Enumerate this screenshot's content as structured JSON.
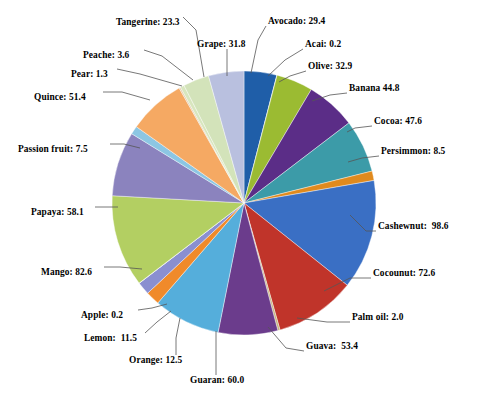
{
  "chart_data": {
    "type": "pie",
    "title": "",
    "subtitle": "",
    "xlabel": "",
    "ylabel": "",
    "legend_position": "none",
    "grid": false,
    "label_format": "name: value",
    "start_angle_deg": -90,
    "direction": "clockwise",
    "total": 723.9,
    "categories": [
      "Avocado",
      "Acai",
      "Olive",
      "Banana",
      "Cocoa",
      "Persimmon",
      "Cashewnut",
      "Cocounut",
      "Palm oil",
      "Guava",
      "Guaran",
      "Orange",
      "Lemon",
      "Apple",
      "Mango",
      "Papaya",
      "Passion fruit",
      "Quince",
      "Pear",
      "Peache",
      "Tangerine",
      "Grape"
    ],
    "values": [
      29.4,
      0.2,
      32.9,
      44.8,
      47.6,
      8.5,
      98.6,
      72.6,
      2.0,
      53.4,
      60.0,
      12.5,
      11.5,
      0.2,
      82.6,
      58.1,
      7.5,
      51.4,
      1.3,
      3.6,
      23.3,
      31.8
    ],
    "colors": [
      "#1F5EA8",
      "#E8EEF4",
      "#9BBB32",
      "#5B2D87",
      "#3C9BA8",
      "#E08A1E",
      "#3A6FC4",
      "#C0342A",
      "#C9B681",
      "#6B3C8C",
      "#55AEDB",
      "#F08A2A",
      "#8A8FD0",
      "#EAF0E0",
      "#B3CF62",
      "#8B83BE",
      "#8CC6E3",
      "#F5A963",
      "#E3C9A8",
      "#D8E6BE",
      "#D3E3BA",
      "#B9C0DF"
    ],
    "slices": [
      {
        "name": "Avocado",
        "label": "Avocado: 29.4",
        "value": 29.4,
        "color": "#1F5EA8"
      },
      {
        "name": "Acai",
        "label": "Acai: 0.2",
        "value": 0.2,
        "color": "#E8EEF4"
      },
      {
        "name": "Olive",
        "label": "Olive: 32.9",
        "value": 32.9,
        "color": "#9BBB32"
      },
      {
        "name": "Banana",
        "label": "Banana 44.8",
        "value": 44.8,
        "color": "#5B2D87"
      },
      {
        "name": "Cocoa",
        "label": "Cocoa: 47.6",
        "value": 47.6,
        "color": "#3C9BA8"
      },
      {
        "name": "Persimmon",
        "label": "Persimmon: 8.5",
        "value": 8.5,
        "color": "#E08A1E"
      },
      {
        "name": "Cashewnut",
        "label": "Cashewnut:  98.6",
        "value": 98.6,
        "color": "#3A6FC4"
      },
      {
        "name": "Cocounut",
        "label": "Cocounut: 72.6",
        "value": 72.6,
        "color": "#C0342A"
      },
      {
        "name": "Palm oil",
        "label": "Palm oil: 2.0",
        "value": 2.0,
        "color": "#C9B681"
      },
      {
        "name": "Guava",
        "label": "Guava:  53.4",
        "value": 53.4,
        "color": "#6B3C8C"
      },
      {
        "name": "Guaran",
        "label": "Guaran: 60.0",
        "value": 60.0,
        "color": "#55AEDB"
      },
      {
        "name": "Orange",
        "label": "Orange: 12.5",
        "value": 12.5,
        "color": "#F08A2A"
      },
      {
        "name": "Lemon",
        "label": "Lemon:  11.5",
        "value": 11.5,
        "color": "#8A8FD0"
      },
      {
        "name": "Apple",
        "label": "Apple: 0.2",
        "value": 0.2,
        "color": "#EAF0E0"
      },
      {
        "name": "Mango",
        "label": "Mango: 82.6",
        "value": 82.6,
        "color": "#B3CF62"
      },
      {
        "name": "Papaya",
        "label": "Papaya: 58.1",
        "value": 58.1,
        "color": "#8B83BE"
      },
      {
        "name": "Passion fruit",
        "label": "Passion fruit: 7.5",
        "value": 7.5,
        "color": "#8CC6E3"
      },
      {
        "name": "Quince",
        "label": "Quince: 51.4",
        "value": 51.4,
        "color": "#F5A963"
      },
      {
        "name": "Pear",
        "label": "Pear: 1.3",
        "value": 1.3,
        "color": "#E3C9A8"
      },
      {
        "name": "Peache",
        "label": "Peache: 3.6",
        "value": 3.6,
        "color": "#D8E6BE"
      },
      {
        "name": "Tangerine",
        "label": "Tangerine: 23.3",
        "value": 23.3,
        "color": "#D3E3BA"
      },
      {
        "name": "Grape",
        "label": "Grape: 31.8",
        "value": 31.8,
        "color": "#B9C0DF"
      }
    ]
  },
  "geometry": {
    "center_x": 244,
    "center_y": 203,
    "radius": 132
  },
  "label_positions": [
    {
      "name": "Avocado",
      "x": 268,
      "y": 17,
      "align": "left",
      "lx": 266,
      "ly": 26,
      "mx": 258,
      "my": 40,
      "ex": 251,
      "ey": 73
    },
    {
      "name": "Acai",
      "x": 305,
      "y": 40,
      "align": "left",
      "lx": 303,
      "ly": 49,
      "mx": 285,
      "my": 60,
      "ex": 268,
      "ey": 76
    },
    {
      "name": "Olive",
      "x": 308,
      "y": 62,
      "align": "left",
      "lx": 306,
      "ly": 71,
      "mx": 290,
      "my": 76,
      "ex": 279,
      "ey": 82
    },
    {
      "name": "Banana",
      "x": 349,
      "y": 84,
      "align": "left",
      "lx": 347,
      "ly": 93,
      "mx": 330,
      "my": 95,
      "ex": 312,
      "ey": 101
    },
    {
      "name": "Cocoa",
      "x": 374,
      "y": 117,
      "align": "left",
      "lx": 372,
      "ly": 126,
      "mx": 355,
      "my": 128,
      "ex": 347,
      "ey": 132
    },
    {
      "name": "Persimmon",
      "x": 381,
      "y": 147,
      "align": "left",
      "lx": 379,
      "ly": 156,
      "mx": 362,
      "my": 158,
      "ex": 348,
      "ey": 162
    },
    {
      "name": "Cashewnut",
      "x": 378,
      "y": 222,
      "align": "left",
      "lx": 376,
      "ly": 231,
      "mx": 366,
      "my": 231,
      "ex": 350,
      "ey": 215
    },
    {
      "name": "Cocounut",
      "x": 373,
      "y": 269,
      "align": "left",
      "lx": 371,
      "ly": 278,
      "mx": 350,
      "my": 278,
      "ex": 324,
      "ey": 291
    },
    {
      "name": "Palm oil",
      "x": 352,
      "y": 313,
      "align": "left",
      "lx": 350,
      "ly": 322,
      "mx": 327,
      "my": 322,
      "ex": 297,
      "ey": 318
    },
    {
      "name": "Guava",
      "x": 306,
      "y": 342,
      "align": "left",
      "lx": 304,
      "ly": 351,
      "mx": 286,
      "my": 348,
      "ex": 268,
      "ey": 327
    },
    {
      "name": "Guaran",
      "x": 190,
      "y": 376,
      "align": "left",
      "lx": 216,
      "ly": 375,
      "mx": 216,
      "my": 356,
      "ex": 216,
      "ey": 331
    },
    {
      "name": "Orange",
      "x": 129,
      "y": 356,
      "align": "left",
      "lx": 176,
      "ly": 355,
      "mx": 176,
      "my": 338,
      "ex": 180,
      "ey": 318
    },
    {
      "name": "Lemon",
      "x": 84,
      "y": 334,
      "align": "left",
      "lx": 145,
      "ly": 333,
      "mx": 157,
      "my": 322,
      "ex": 171,
      "ey": 311
    },
    {
      "name": "Apple",
      "x": 81,
      "y": 311,
      "align": "left",
      "lx": 138,
      "ly": 310,
      "mx": 152,
      "my": 308,
      "ex": 167,
      "ey": 304
    },
    {
      "name": "Mango",
      "x": 41,
      "y": 268,
      "align": "left",
      "lx": 104,
      "ly": 267,
      "mx": 120,
      "my": 267,
      "ex": 142,
      "ey": 269
    },
    {
      "name": "Papaya",
      "x": 31,
      "y": 208,
      "align": "left",
      "lx": 95,
      "ly": 207,
      "mx": 105,
      "my": 207,
      "ex": 118,
      "ey": 207
    },
    {
      "name": "Passion fruit",
      "x": 18,
      "y": 145,
      "align": "left",
      "lx": 110,
      "ly": 144,
      "mx": 124,
      "my": 144,
      "ex": 140,
      "ey": 148
    },
    {
      "name": "Quince",
      "x": 34,
      "y": 93,
      "align": "left",
      "lx": 103,
      "ly": 92,
      "mx": 122,
      "my": 92,
      "ex": 150,
      "ey": 100
    },
    {
      "name": "Pear",
      "x": 71,
      "y": 70,
      "align": "left",
      "lx": 117,
      "ly": 69,
      "mx": 140,
      "my": 74,
      "ex": 182,
      "ey": 86
    },
    {
      "name": "Peache",
      "x": 83,
      "y": 51,
      "align": "left",
      "lx": 144,
      "ly": 50,
      "mx": 162,
      "my": 56,
      "ex": 193,
      "ey": 80
    },
    {
      "name": "Tangerine",
      "x": 116,
      "y": 18,
      "align": "left",
      "lx": 183,
      "ly": 17,
      "mx": 196,
      "my": 30,
      "ex": 204,
      "ey": 77
    },
    {
      "name": "Grape",
      "x": 197,
      "y": 40,
      "align": "left",
      "lx": 227,
      "ly": 49,
      "mx": 227,
      "my": 58,
      "ex": 227,
      "ey": 76
    }
  ]
}
